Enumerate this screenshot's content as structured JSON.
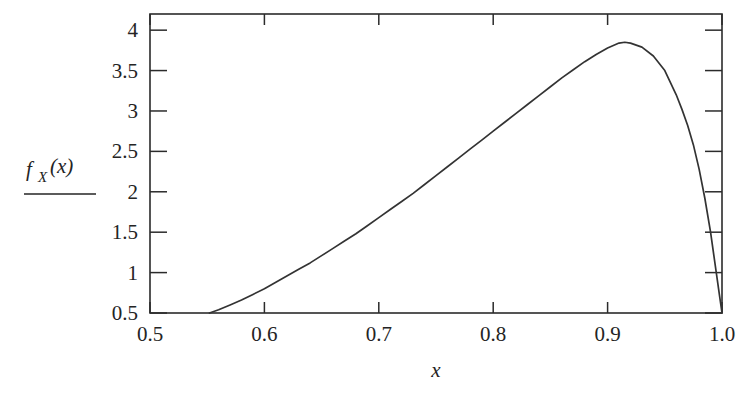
{
  "chart_data": {
    "type": "line",
    "title": "",
    "subtitle": "",
    "xlabel": "x",
    "ylabel": "f_X(x)",
    "ylabel_parts": {
      "f": "f",
      "sub": "X",
      "arg": "(x)"
    },
    "ylabel_has_rule": true,
    "xlim": [
      0.5,
      1.0
    ],
    "ylim": [
      0.5,
      4.2
    ],
    "grid": false,
    "legend": null,
    "legend_position": "none",
    "frame": "box",
    "tick_direction": "in",
    "ticks_all_sides": true,
    "xticks": [
      0.5,
      0.6,
      0.7,
      0.8,
      0.9,
      1.0
    ],
    "xtick_labels": [
      "0.5",
      "0.6",
      "0.7",
      "0.8",
      "0.9",
      "1.0"
    ],
    "yticks": [
      0.5,
      1,
      1.5,
      2,
      2.5,
      3,
      3.5,
      4
    ],
    "ytick_labels": [
      "0.5",
      "1",
      "1.5",
      "2",
      "2.5",
      "3",
      "3.5",
      "4"
    ],
    "series": [
      {
        "name": "f_X(x)",
        "color": "#333333",
        "x": [
          0.552,
          0.56,
          0.57,
          0.58,
          0.59,
          0.6,
          0.61,
          0.62,
          0.63,
          0.64,
          0.65,
          0.66,
          0.67,
          0.68,
          0.69,
          0.7,
          0.71,
          0.72,
          0.73,
          0.74,
          0.75,
          0.76,
          0.77,
          0.78,
          0.79,
          0.8,
          0.81,
          0.82,
          0.83,
          0.84,
          0.85,
          0.86,
          0.87,
          0.88,
          0.89,
          0.9,
          0.91,
          0.915,
          0.92,
          0.93,
          0.94,
          0.95,
          0.96,
          0.965,
          0.97,
          0.975,
          0.98,
          0.985,
          0.99,
          0.995,
          0.998,
          1.0
        ],
        "y": [
          0.5,
          0.54,
          0.6,
          0.66,
          0.73,
          0.8,
          0.88,
          0.96,
          1.04,
          1.12,
          1.21,
          1.3,
          1.39,
          1.48,
          1.58,
          1.68,
          1.78,
          1.88,
          1.98,
          2.09,
          2.2,
          2.31,
          2.42,
          2.53,
          2.64,
          2.75,
          2.86,
          2.97,
          3.08,
          3.19,
          3.3,
          3.41,
          3.51,
          3.61,
          3.7,
          3.78,
          3.84,
          3.85,
          3.84,
          3.79,
          3.68,
          3.5,
          3.2,
          3.02,
          2.82,
          2.58,
          2.28,
          1.92,
          1.5,
          1.0,
          0.7,
          0.5
        ]
      }
    ],
    "annotations": []
  },
  "axes": {
    "x_axis_name": "x-axis",
    "y_axis_name": "y-axis",
    "x_label_text": "x"
  }
}
